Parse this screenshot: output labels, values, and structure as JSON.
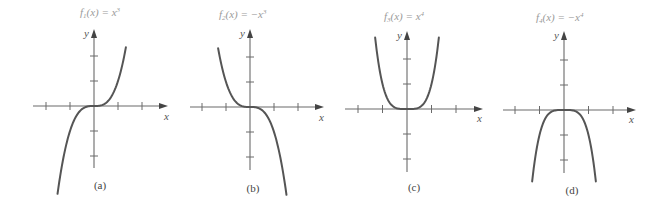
{
  "chart_data": [
    {
      "type": "line",
      "panel_label": "(a)",
      "title": "f₁(x) = x³",
      "function": "x^3",
      "exponent": 3,
      "sign": 1,
      "xlabel": "x",
      "ylabel": "y",
      "x_ticks": [
        -2,
        -1,
        0,
        1,
        2
      ],
      "y_ticks": [
        -2,
        -1,
        0,
        1,
        2
      ],
      "tick_labels_shown": false,
      "grid": false,
      "xlim": [
        -2.5,
        3
      ],
      "ylim": [
        -2.5,
        3
      ],
      "x": [
        -1.5,
        -1.25,
        -1,
        -0.75,
        -0.5,
        -0.25,
        0,
        0.25,
        0.5,
        0.75,
        1,
        1.25,
        1.33
      ],
      "y": [
        -3.375,
        -1.953,
        -1,
        -0.422,
        -0.125,
        -0.016,
        0,
        0.016,
        0.125,
        0.422,
        1,
        1.953,
        2.35
      ]
    },
    {
      "type": "line",
      "panel_label": "(b)",
      "title": "f₂(x) = −x³",
      "function": "-x^3",
      "exponent": 3,
      "sign": -1,
      "xlabel": "x",
      "ylabel": "y",
      "x_ticks": [
        -2,
        -1,
        0,
        1,
        2
      ],
      "y_ticks": [
        -2,
        -1,
        0,
        1,
        2
      ],
      "tick_labels_shown": false,
      "grid": false,
      "xlim": [
        -2.5,
        3
      ],
      "ylim": [
        -2.5,
        3
      ],
      "x": [
        -1.33,
        -1.25,
        -1,
        -0.75,
        -0.5,
        -0.25,
        0,
        0.25,
        0.5,
        0.75,
        1,
        1.25,
        1.33
      ],
      "y": [
        2.35,
        1.953,
        1,
        0.422,
        0.125,
        0.016,
        0,
        -0.016,
        -0.125,
        -0.422,
        -1,
        -1.953,
        -2.35
      ]
    },
    {
      "type": "line",
      "panel_label": "(c)",
      "title": "f₃(x) = x⁴",
      "function": "x^4",
      "exponent": 4,
      "sign": 1,
      "xlabel": "x",
      "ylabel": "y",
      "x_ticks": [
        -2,
        -1,
        0,
        1,
        2
      ],
      "y_ticks": [
        -2,
        -1,
        0,
        1,
        2
      ],
      "tick_labels_shown": false,
      "grid": false,
      "xlim": [
        -2.5,
        3
      ],
      "ylim": [
        -2.5,
        3
      ],
      "x": [
        -1.3,
        -1.2,
        -1,
        -0.8,
        -0.6,
        -0.4,
        -0.2,
        0,
        0.2,
        0.4,
        0.6,
        0.8,
        1,
        1.2,
        1.3
      ],
      "y": [
        2.856,
        2.074,
        1,
        0.41,
        0.13,
        0.026,
        0.002,
        0,
        0.002,
        0.026,
        0.13,
        0.41,
        1,
        2.074,
        2.856
      ]
    },
    {
      "type": "line",
      "panel_label": "(d)",
      "title": "f₄(x) = −x⁴",
      "function": "-x^4",
      "exponent": 4,
      "sign": -1,
      "xlabel": "x",
      "ylabel": "y",
      "x_ticks": [
        -2,
        -1,
        0,
        1,
        2
      ],
      "y_ticks": [
        -2,
        -1,
        0,
        1,
        2
      ],
      "tick_labels_shown": false,
      "grid": false,
      "xlim": [
        -2.5,
        3
      ],
      "ylim": [
        -2.5,
        3
      ],
      "x": [
        -1.3,
        -1.2,
        -1,
        -0.8,
        -0.6,
        -0.4,
        -0.2,
        0,
        0.2,
        0.4,
        0.6,
        0.8,
        1,
        1.2,
        1.3
      ],
      "y": [
        -2.856,
        -2.074,
        -1,
        -0.41,
        -0.13,
        -0.026,
        -0.002,
        0,
        -0.002,
        -0.026,
        -0.13,
        -0.41,
        -1,
        -2.074,
        -2.856
      ]
    }
  ],
  "panels": [
    {
      "title_main": "f",
      "title_sub": "1",
      "title_rest": "(x)  =  x",
      "title_sup": "3",
      "xlabel": "x",
      "ylabel": "y",
      "label": "(a)",
      "layout": {
        "ox": 94,
        "oy": 106,
        "ux": 24,
        "uy": 25,
        "xmin": 33,
        "xmax": 168,
        "ytop": 29,
        "ybot": 168,
        "xrange": [
          -1.52,
          1.33
        ],
        "title_x": 80,
        "title_y": 16,
        "label_x": 100,
        "label_y": 189,
        "xl_x": 164,
        "xl_y": 120,
        "yl_x": 84,
        "yl_y": 37
      }
    },
    {
      "title_main": "f",
      "title_sub": "2",
      "title_rest": "(x)  =  −x",
      "title_sup": "3",
      "xlabel": "x",
      "ylabel": "y",
      "label": "(b)",
      "layout": {
        "ox": 250,
        "oy": 107,
        "ux": 24,
        "uy": 25,
        "xmin": 190,
        "xmax": 324,
        "ytop": 29,
        "ybot": 170,
        "xrange": [
          -1.33,
          1.52
        ],
        "title_x": 219,
        "title_y": 18,
        "label_x": 253,
        "label_y": 192,
        "xl_x": 319,
        "xl_y": 121,
        "yl_x": 240,
        "yl_y": 37
      }
    },
    {
      "title_main": "f",
      "title_sub": "3",
      "title_rest": "(x)  =  x",
      "title_sup": "4",
      "xlabel": "x",
      "ylabel": "y",
      "label": "(c)",
      "layout": {
        "ox": 407,
        "oy": 109,
        "ux": 24.5,
        "uy": 25,
        "xmin": 345,
        "xmax": 483,
        "ytop": 31,
        "ybot": 172,
        "xrange": [
          -1.3,
          1.3
        ],
        "title_x": 384,
        "title_y": 20,
        "label_x": 414,
        "label_y": 191,
        "xl_x": 477,
        "xl_y": 122,
        "yl_x": 397,
        "yl_y": 39
      }
    },
    {
      "title_main": "f",
      "title_sub": "4",
      "title_rest": "(x)  =  −x",
      "title_sup": "4",
      "xlabel": "x",
      "ylabel": "y",
      "label": "(d)",
      "layout": {
        "ox": 564,
        "oy": 110,
        "ux": 24.5,
        "uy": 25,
        "xmin": 503,
        "xmax": 636,
        "ytop": 31,
        "ybot": 173,
        "xrange": [
          -1.3,
          1.3
        ],
        "title_x": 536,
        "title_y": 21,
        "label_x": 572,
        "label_y": 194,
        "xl_x": 629,
        "xl_y": 123,
        "yl_x": 554,
        "yl_y": 39
      }
    }
  ]
}
